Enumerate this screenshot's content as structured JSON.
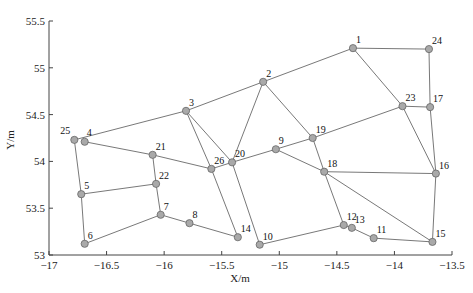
{
  "chart_data": {
    "type": "scatter",
    "subtype": "network-graph",
    "title": "",
    "xlabel": "X/m",
    "ylabel": "Y/m",
    "xlim": [
      -17,
      -13.5
    ],
    "ylim": [
      53,
      55.5
    ],
    "xticks": [
      -17,
      -16.5,
      -16,
      -15.5,
      -15,
      -14.5,
      -14,
      -13.5
    ],
    "yticks": [
      53,
      53.5,
      54,
      54.5,
      55,
      55.5
    ],
    "xtick_labels": [
      "-17",
      "-16.5",
      "-16",
      "-15.5",
      "-15",
      "-14.5",
      "-14",
      "-13.5"
    ],
    "ytick_labels": [
      "53",
      "53.5",
      "54",
      "54.5",
      "55",
      "55.5"
    ],
    "grid": false,
    "legend": null,
    "node_color": "#a9a9a9",
    "edge_color": "#555555",
    "nodes": [
      {
        "id": "1",
        "x": -14.36,
        "y": 55.21
      },
      {
        "id": "2",
        "x": -15.14,
        "y": 54.85
      },
      {
        "id": "3",
        "x": -15.81,
        "y": 54.54
      },
      {
        "id": "4",
        "x": -16.69,
        "y": 54.21
      },
      {
        "id": "5",
        "x": -16.72,
        "y": 53.65
      },
      {
        "id": "6",
        "x": -16.69,
        "y": 53.12
      },
      {
        "id": "7",
        "x": -16.03,
        "y": 53.43
      },
      {
        "id": "8",
        "x": -15.78,
        "y": 53.34
      },
      {
        "id": "9",
        "x": -15.03,
        "y": 54.13
      },
      {
        "id": "10",
        "x": -15.17,
        "y": 53.11
      },
      {
        "id": "11",
        "x": -14.18,
        "y": 53.18
      },
      {
        "id": "12",
        "x": -14.44,
        "y": 53.32
      },
      {
        "id": "13",
        "x": -14.37,
        "y": 53.29
      },
      {
        "id": "14",
        "x": -15.36,
        "y": 53.19
      },
      {
        "id": "15",
        "x": -13.67,
        "y": 53.14
      },
      {
        "id": "16",
        "x": -13.64,
        "y": 53.87
      },
      {
        "id": "17",
        "x": -13.69,
        "y": 54.58
      },
      {
        "id": "18",
        "x": -14.61,
        "y": 53.89
      },
      {
        "id": "19",
        "x": -14.71,
        "y": 54.25
      },
      {
        "id": "20",
        "x": -15.41,
        "y": 53.99
      },
      {
        "id": "21",
        "x": -16.1,
        "y": 54.07
      },
      {
        "id": "22",
        "x": -16.07,
        "y": 53.76
      },
      {
        "id": "23",
        "x": -13.93,
        "y": 54.59
      },
      {
        "id": "24",
        "x": -13.7,
        "y": 55.2
      },
      {
        "id": "25",
        "x": -16.78,
        "y": 54.23
      },
      {
        "id": "26",
        "x": -15.59,
        "y": 53.92
      }
    ],
    "edges": [
      [
        "25",
        "3"
      ],
      [
        "25",
        "5"
      ],
      [
        "4",
        "21"
      ],
      [
        "3",
        "2"
      ],
      [
        "2",
        "1"
      ],
      [
        "1",
        "24"
      ],
      [
        "24",
        "17"
      ],
      [
        "1",
        "23"
      ],
      [
        "23",
        "17"
      ],
      [
        "17",
        "16"
      ],
      [
        "23",
        "16"
      ],
      [
        "16",
        "15"
      ],
      [
        "18",
        "16"
      ],
      [
        "18",
        "15"
      ],
      [
        "19",
        "23"
      ],
      [
        "2",
        "19"
      ],
      [
        "2",
        "20"
      ],
      [
        "3",
        "20"
      ],
      [
        "3",
        "26"
      ],
      [
        "21",
        "26"
      ],
      [
        "26",
        "20"
      ],
      [
        "20",
        "9"
      ],
      [
        "9",
        "19"
      ],
      [
        "9",
        "18"
      ],
      [
        "19",
        "18"
      ],
      [
        "18",
        "12"
      ],
      [
        "12",
        "13"
      ],
      [
        "13",
        "11"
      ],
      [
        "11",
        "15"
      ],
      [
        "10",
        "12"
      ],
      [
        "20",
        "10"
      ],
      [
        "26",
        "14"
      ],
      [
        "21",
        "22"
      ],
      [
        "22",
        "5"
      ],
      [
        "5",
        "6"
      ],
      [
        "22",
        "7"
      ],
      [
        "6",
        "7"
      ],
      [
        "7",
        "8"
      ],
      [
        "8",
        "14"
      ]
    ],
    "label_offsets": {
      "25": [
        -14,
        -6
      ],
      "4": [
        2,
        -6
      ]
    }
  }
}
